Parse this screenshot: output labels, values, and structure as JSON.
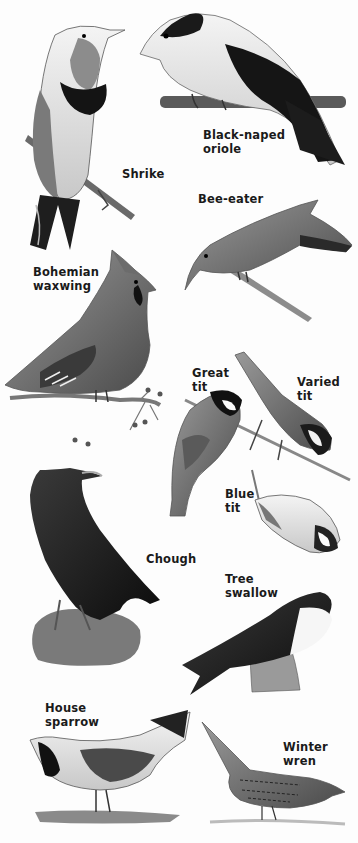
{
  "plate": {
    "background": "#fdfdfd",
    "ink": "#1a1a1a",
    "birds": [
      {
        "id": "shrike",
        "lines": [
          "Shrike"
        ],
        "x": 122,
        "y": 167
      },
      {
        "id": "black-naped-oriole",
        "lines": [
          "Black-naped",
          "oriole"
        ],
        "x": 203,
        "y": 128
      },
      {
        "id": "bee-eater",
        "lines": [
          "Bee-eater"
        ],
        "x": 198,
        "y": 192
      },
      {
        "id": "bohemian-waxwing",
        "lines": [
          "Bohemian",
          "waxwing"
        ],
        "x": 33,
        "y": 265
      },
      {
        "id": "great-tit",
        "lines": [
          "Great",
          "tit"
        ],
        "x": 192,
        "y": 366
      },
      {
        "id": "varied-tit",
        "lines": [
          "Varied",
          "tit"
        ],
        "x": 297,
        "y": 375
      },
      {
        "id": "blue-tit",
        "lines": [
          "Blue",
          "tit"
        ],
        "x": 225,
        "y": 487
      },
      {
        "id": "chough",
        "lines": [
          "Chough"
        ],
        "x": 146,
        "y": 552
      },
      {
        "id": "tree-swallow",
        "lines": [
          "Tree",
          "swallow"
        ],
        "x": 225,
        "y": 572
      },
      {
        "id": "house-sparrow",
        "lines": [
          "House",
          "sparrow"
        ],
        "x": 45,
        "y": 701
      },
      {
        "id": "winter-wren",
        "lines": [
          "Winter",
          "wren"
        ],
        "x": 283,
        "y": 740
      }
    ]
  }
}
